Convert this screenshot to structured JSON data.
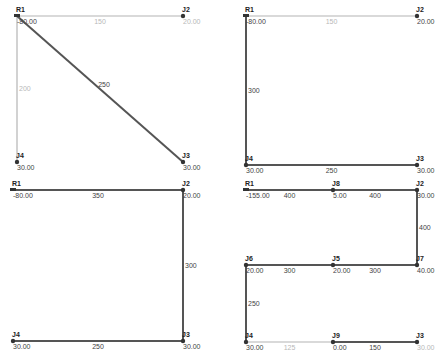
{
  "colors": {
    "pipe_dark": "#555555",
    "pipe_light": "#b4b4b4",
    "node": "#333333",
    "text": "#444444",
    "text_light": "#b8b8b8"
  },
  "panels": [
    {
      "id": "top-left",
      "nodes": [
        {
          "name": "R1",
          "value": "-80.00",
          "x": 17,
          "y": 16,
          "type": "reservoir"
        },
        {
          "name": "J2",
          "value": "20.00",
          "x": 183,
          "y": 16,
          "value_light": true
        },
        {
          "name": "J3",
          "value": "30.00",
          "x": 183,
          "y": 162
        },
        {
          "name": "J4",
          "value": "30.00",
          "x": 17,
          "y": 162
        }
      ],
      "pipes": [
        {
          "from": "R1",
          "to": "J2",
          "label": "150",
          "style": "light"
        },
        {
          "from": "R1",
          "to": "J4",
          "label": "200",
          "style": "light"
        },
        {
          "from": "R1",
          "to": "J3",
          "label": "250",
          "style": "dark"
        }
      ]
    },
    {
      "id": "top-right",
      "nodes": [
        {
          "name": "R1",
          "value": "-80.00",
          "x": 246,
          "y": 16,
          "type": "reservoir"
        },
        {
          "name": "J2",
          "value": "20.00",
          "x": 417,
          "y": 16
        },
        {
          "name": "J3",
          "value": "30.00",
          "x": 417,
          "y": 165
        },
        {
          "name": "J4",
          "value": "30.00",
          "x": 246,
          "y": 165
        }
      ],
      "pipes": [
        {
          "from": "R1",
          "to": "J2",
          "label": "150",
          "style": "light"
        },
        {
          "from": "R1",
          "to": "J4",
          "label": "300",
          "style": "dark"
        },
        {
          "from": "J4",
          "to": "J3",
          "label": "250",
          "style": "dark"
        }
      ]
    },
    {
      "id": "bottom-left",
      "nodes": [
        {
          "name": "R1",
          "value": "-80.00",
          "x": 13,
          "y": 190,
          "type": "reservoir"
        },
        {
          "name": "J2",
          "value": "20.00",
          "x": 183,
          "y": 190
        },
        {
          "name": "J3",
          "value": "30.00",
          "x": 183,
          "y": 341
        },
        {
          "name": "J4",
          "value": "30.00",
          "x": 13,
          "y": 341
        }
      ],
      "pipes": [
        {
          "from": "R1",
          "to": "J2",
          "label": "350",
          "style": "dark"
        },
        {
          "from": "J2",
          "to": "J3",
          "label": "300",
          "style": "dark"
        },
        {
          "from": "J4",
          "to": "J3",
          "label": "250",
          "style": "dark"
        }
      ]
    },
    {
      "id": "bottom-right",
      "nodes": [
        {
          "name": "R1",
          "value": "-155.00",
          "x": 246,
          "y": 190,
          "type": "reservoir"
        },
        {
          "name": "J8",
          "value": "5.00",
          "x": 333,
          "y": 190
        },
        {
          "name": "J2",
          "value": "30.00",
          "x": 417,
          "y": 190
        },
        {
          "name": "J7",
          "value": "40.00",
          "x": 417,
          "y": 265
        },
        {
          "name": "J5",
          "value": "20.00",
          "x": 333,
          "y": 265
        },
        {
          "name": "J6",
          "value": "20.00",
          "x": 246,
          "y": 265
        },
        {
          "name": "J4",
          "value": "30.00",
          "x": 246,
          "y": 342
        },
        {
          "name": "J9",
          "value": "0.00",
          "x": 333,
          "y": 342
        },
        {
          "name": "J3",
          "value": "30.00",
          "x": 417,
          "y": 342,
          "value_light": true
        }
      ],
      "pipes": [
        {
          "from": "R1",
          "to": "J8",
          "label": "400",
          "style": "dark"
        },
        {
          "from": "J8",
          "to": "J2",
          "label": "400",
          "style": "dark"
        },
        {
          "from": "J2",
          "to": "J7",
          "label": "400",
          "style": "dark"
        },
        {
          "from": "J7",
          "to": "J5",
          "label": "300",
          "style": "dark"
        },
        {
          "from": "J5",
          "to": "J6",
          "label": "300",
          "style": "dark"
        },
        {
          "from": "J6",
          "to": "J4",
          "label": "250",
          "style": "dark"
        },
        {
          "from": "J4",
          "to": "J9",
          "label": "125",
          "style": "light"
        },
        {
          "from": "J9",
          "to": "J3",
          "label": "150",
          "style": "dark"
        }
      ]
    }
  ]
}
